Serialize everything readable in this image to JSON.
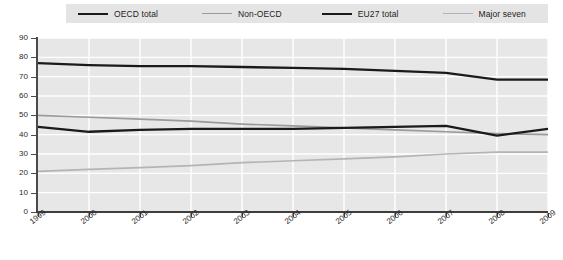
{
  "legend": {
    "position": "top",
    "items": [
      {
        "label": "OECD total",
        "color": "#1a1a1a",
        "icon": "line-swatch-icon"
      },
      {
        "label": "Non-OECD",
        "color": "#9a9a9a",
        "icon": "line-swatch-icon"
      },
      {
        "label": "EU27 total",
        "color": "#1a1a1a",
        "icon": "line-swatch-icon"
      },
      {
        "label": "Major seven",
        "color": "#b4b4b4",
        "icon": "line-swatch-icon"
      }
    ]
  },
  "axes": {
    "y_ticks": [
      "0",
      "10",
      "20",
      "30",
      "40",
      "50",
      "60",
      "70",
      "80",
      "90"
    ],
    "x_ticks": [
      "1999",
      "2000",
      "2001",
      "2002",
      "2003",
      "2004",
      "2005",
      "2006",
      "2007",
      "2008",
      "2009"
    ]
  },
  "chart_data": {
    "type": "line",
    "title": "",
    "subtitle": "",
    "xlabel": "",
    "ylabel": "",
    "x": [
      1999,
      2000,
      2001,
      2002,
      2003,
      2004,
      2005,
      2006,
      2007,
      2008,
      2009
    ],
    "categories": [
      "1999",
      "2000",
      "2001",
      "2002",
      "2003",
      "2004",
      "2005",
      "2006",
      "2007",
      "2008",
      "2009"
    ],
    "ylim": [
      0,
      90
    ],
    "xlim": [
      1999,
      2009
    ],
    "grid": true,
    "legend_position": "top",
    "series": [
      {
        "name": "OECD total",
        "color": "#1a1a1a",
        "values": [
          77,
          76,
          75.5,
          75.5,
          75,
          74.5,
          74,
          73,
          72,
          68.5,
          68.5
        ]
      },
      {
        "name": "Non-OECD",
        "color": "#9a9a9a",
        "values": [
          50,
          49,
          48,
          47,
          45.5,
          44.5,
          43.5,
          42.5,
          41.5,
          40.5,
          40
        ]
      },
      {
        "name": "EU27 total",
        "color": "#1a1a1a",
        "values": [
          44,
          41.5,
          42.5,
          43,
          43,
          43,
          43.5,
          44,
          44.5,
          39.5,
          43
        ]
      },
      {
        "name": "Major seven",
        "color": "#b4b4b4",
        "values": [
          21,
          22,
          23,
          24,
          25.5,
          26.5,
          27.5,
          28.5,
          30,
          31,
          31
        ]
      }
    ]
  }
}
